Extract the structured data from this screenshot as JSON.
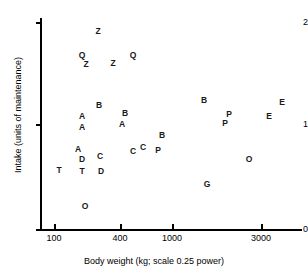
{
  "chart_data": {
    "type": "scatter",
    "title": "",
    "xlabel": "Body weight (kg; scale 0.25 power)",
    "ylabel": "Intake (units of maintenance)",
    "grid": false,
    "legend": "none",
    "x_scale": "0.25 power",
    "x_ticks": [
      {
        "label": "100",
        "px": 54
      },
      {
        "label": "400",
        "px": 120
      },
      {
        "label": "1000",
        "px": 172
      },
      {
        "label": "3000",
        "px": 261
      }
    ],
    "y_ticks": [
      {
        "label": "0",
        "px": 229
      },
      {
        "label": "1",
        "px": 124
      },
      {
        "label": "2",
        "px": 22
      }
    ],
    "ylim": [
      0,
      2.1
    ],
    "points": [
      {
        "label": "Z",
        "x": 98,
        "y": 32,
        "bw": 260,
        "intake": 1.93
      },
      {
        "label": "Q",
        "x": 82,
        "y": 56,
        "bw": 200,
        "intake": 1.7
      },
      {
        "label": "Z",
        "x": 86,
        "y": 65,
        "bw": 215,
        "intake": 1.61
      },
      {
        "label": "Z",
        "x": 113,
        "y": 64,
        "bw": 330,
        "intake": 1.62
      },
      {
        "label": "Q",
        "x": 133,
        "y": 56,
        "bw": 460,
        "intake": 1.7
      },
      {
        "label": "B",
        "x": 99,
        "y": 106,
        "bw": 265,
        "intake": 1.17
      },
      {
        "label": "B",
        "x": 125,
        "y": 114,
        "bw": 400,
        "intake": 1.1
      },
      {
        "label": "A",
        "x": 82,
        "y": 117,
        "bw": 205,
        "intake": 1.07
      },
      {
        "label": "A",
        "x": 82,
        "y": 128,
        "bw": 205,
        "intake": 0.97
      },
      {
        "label": "A",
        "x": 122,
        "y": 125,
        "bw": 385,
        "intake": 1.0
      },
      {
        "label": "A",
        "x": 78,
        "y": 150,
        "bw": 190,
        "intake": 0.77
      },
      {
        "label": "D",
        "x": 82,
        "y": 160,
        "bw": 205,
        "intake": 0.68
      },
      {
        "label": "T",
        "x": 59,
        "y": 171,
        "bw": 120,
        "intake": 0.57
      },
      {
        "label": "T",
        "x": 82,
        "y": 172,
        "bw": 205,
        "intake": 0.56
      },
      {
        "label": "C",
        "x": 100,
        "y": 157,
        "bw": 270,
        "intake": 0.71
      },
      {
        "label": "D",
        "x": 101,
        "y": 172,
        "bw": 275,
        "intake": 0.56
      },
      {
        "label": "O",
        "x": 85,
        "y": 207,
        "bw": 212,
        "intake": 0.22
      },
      {
        "label": "C",
        "x": 133,
        "y": 152,
        "bw": 460,
        "intake": 0.76
      },
      {
        "label": "C",
        "x": 143,
        "y": 148,
        "bw": 540,
        "intake": 0.79
      },
      {
        "label": "P",
        "x": 158,
        "y": 151,
        "bw": 700,
        "intake": 0.77
      },
      {
        "label": "B",
        "x": 162,
        "y": 136,
        "bw": 760,
        "intake": 0.9
      },
      {
        "label": "B",
        "x": 204,
        "y": 101,
        "bw": 1400,
        "intake": 1.22
      },
      {
        "label": "P",
        "x": 229,
        "y": 115,
        "bw": 2000,
        "intake": 1.09
      },
      {
        "label": "P",
        "x": 225,
        "y": 124,
        "bw": 1900,
        "intake": 1.0
      },
      {
        "label": "E",
        "x": 282,
        "y": 103,
        "bw": 3300,
        "intake": 1.2
      },
      {
        "label": "E",
        "x": 269,
        "y": 117,
        "bw": 3000,
        "intake": 1.06
      },
      {
        "label": "O",
        "x": 249,
        "y": 160,
        "bw": 2400,
        "intake": 0.67
      },
      {
        "label": "G",
        "x": 207,
        "y": 185,
        "bw": 1450,
        "intake": 0.42
      }
    ]
  }
}
